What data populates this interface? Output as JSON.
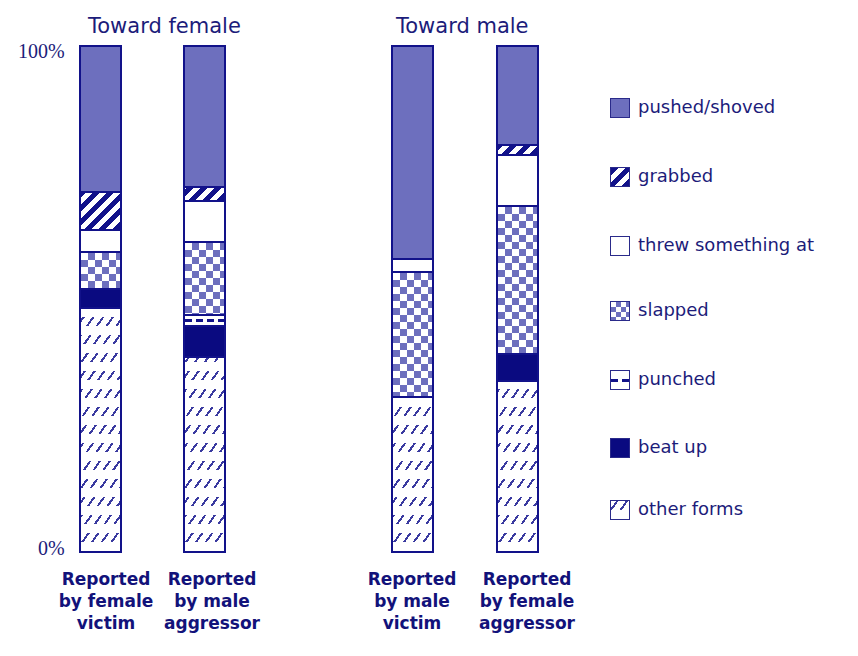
{
  "chart_data": {
    "type": "bar",
    "stacked": true,
    "normalized": true,
    "title": "",
    "groups": [
      {
        "title": "Toward female",
        "categories": [
          "Reported by female victim",
          "Reported by male aggressor"
        ]
      },
      {
        "title": "Toward male",
        "categories": [
          "Reported by male victim",
          "Reported by female aggressor"
        ]
      }
    ],
    "categories": [
      "Reported by female victim",
      "Reported by male aggressor",
      "Reported by male victim",
      "Reported by female aggressor"
    ],
    "series": [
      {
        "name": "pushed/shoved",
        "values": [
          28.6,
          27.6,
          42.0,
          19.3
        ]
      },
      {
        "name": "grabbed",
        "values": [
          7.5,
          2.8,
          0,
          2.0
        ]
      },
      {
        "name": "threw something at",
        "values": [
          4.3,
          8.1,
          2.4,
          10.1
        ]
      },
      {
        "name": "slapped",
        "values": [
          7.3,
          14.6,
          24.9,
          29.4
        ]
      },
      {
        "name": "punched",
        "values": [
          0,
          2.2,
          0,
          0
        ]
      },
      {
        "name": "beat up",
        "values": [
          3.9,
          6.1,
          0,
          5.3
        ]
      },
      {
        "name": "other forms",
        "values": [
          48.3,
          38.7,
          30.8,
          33.9
        ]
      }
    ],
    "stack_order_top_to_bottom": [
      "pushed/shoved",
      "grabbed",
      "threw something at",
      "slapped",
      "punched",
      "beat up",
      "other forms"
    ],
    "xlabel": "",
    "ylabel": "",
    "ylim": [
      0,
      100
    ],
    "ytick_labels": [
      "0%",
      "100%"
    ],
    "grid": false,
    "legend_position": "right"
  },
  "labels": {
    "group_female": "Toward female",
    "group_male": "Toward male",
    "y_top": "100%",
    "y_bottom": "0%",
    "cat1": [
      "Reported",
      "by female",
      "victim"
    ],
    "cat2": [
      "Reported",
      "by male",
      "aggressor"
    ],
    "cat3": [
      "Reported",
      "by male",
      "victim"
    ],
    "cat4": [
      "Reported",
      "by female",
      "aggressor"
    ]
  },
  "legend": [
    {
      "label": "pushed/shoved",
      "pattern": "solid-medium-blue",
      "color": "#6d6fbe"
    },
    {
      "label": "grabbed",
      "pattern": "bold-diagonal-stripes",
      "color": "#12128a"
    },
    {
      "label": "threw something at",
      "pattern": "white",
      "color": "#ffffff"
    },
    {
      "label": "slapped",
      "pattern": "checkerboard",
      "color": "#6d6fbe"
    },
    {
      "label": "punched",
      "pattern": "dashed-lines",
      "color": "#12128a"
    },
    {
      "label": "beat up",
      "pattern": "solid-dark-navy",
      "color": "#0a0a80"
    },
    {
      "label": "other forms",
      "pattern": "light-diagonal-hatch",
      "color": "#3a3aa0"
    }
  ]
}
